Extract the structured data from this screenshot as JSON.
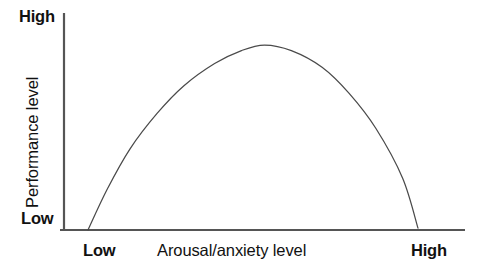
{
  "chart_data": {
    "type": "line",
    "title": "",
    "xlabel": "Arousal/anxiety level",
    "ylabel": "Performance level",
    "x_tick_labels": [
      "Low",
      "High"
    ],
    "y_tick_labels": [
      "Low",
      "High"
    ],
    "xlim": [
      0,
      1
    ],
    "ylim": [
      0,
      1
    ],
    "grid": false,
    "legend": "none",
    "annotations": [],
    "curve_color": "#4a4a4a",
    "axis_color": "#555555",
    "background_color": "#ffffff",
    "series": [
      {
        "name": "Performance vs arousal",
        "description": "Inverted-U curve peaking at moderate arousal",
        "x": [
          0.07,
          0.12,
          0.18,
          0.25,
          0.32,
          0.4,
          0.47,
          0.53,
          0.6,
          0.68,
          0.75,
          0.82,
          0.89,
          0.93
        ],
        "y": [
          0.0,
          0.22,
          0.44,
          0.63,
          0.78,
          0.9,
          0.97,
          1.0,
          0.97,
          0.88,
          0.74,
          0.55,
          0.28,
          0.01
        ]
      }
    ],
    "peak": {
      "x": 0.53,
      "y": 1.0
    }
  },
  "axis": {
    "y_high": "High",
    "y_low": "Low",
    "y_title": "Performance level",
    "x_low": "Low",
    "x_title": "Arousal/anxiety level",
    "x_high": "High"
  }
}
